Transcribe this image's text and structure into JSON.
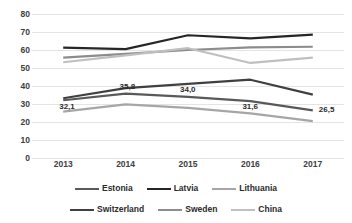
{
  "chart_data": {
    "type": "line",
    "title": "",
    "xlabel": "",
    "ylabel": "",
    "categories": [
      "2013",
      "2014",
      "2015",
      "2016",
      "2017"
    ],
    "x_tick_labels": [
      "2013",
      "2014",
      "2015",
      "2016",
      "2017"
    ],
    "y_tick_labels": [
      "0",
      "10",
      "20",
      "30",
      "40",
      "50",
      "60",
      "70",
      "80"
    ],
    "y_ticks": [
      0,
      10,
      20,
      30,
      40,
      50,
      60,
      70,
      80
    ],
    "ylim": [
      0,
      80
    ],
    "grid": true,
    "grid_axis": "y",
    "legend_position": "bottom",
    "decimal_separator": ",",
    "series": [
      {
        "name": "Estonia",
        "color": "#595959",
        "width": 2.2,
        "values": [
          32.1,
          35.8,
          34.0,
          31.6,
          26.5
        ],
        "labels": [
          "32,1",
          "35,8",
          "34,0",
          "31,6",
          "26,5"
        ]
      },
      {
        "name": "Latvia",
        "color": "#262626",
        "width": 2.2,
        "values": [
          61.3,
          60.5,
          68.2,
          66.5,
          68.5
        ],
        "labels": [
          "",
          "",
          "",
          "",
          ""
        ]
      },
      {
        "name": "Lithuania",
        "color": "#a6a6a6",
        "width": 2.2,
        "values": [
          25.8,
          29.8,
          27.8,
          24.8,
          20.5
        ],
        "labels": [
          "",
          "",
          "",
          "",
          ""
        ]
      },
      {
        "name": "Switzerland",
        "color": "#404040",
        "width": 2.2,
        "values": [
          33.2,
          38.8,
          41.2,
          43.5,
          35.2
        ],
        "labels": [
          "",
          "",
          "",
          "",
          ""
        ]
      },
      {
        "name": "Sweden",
        "color": "#8c8c8c",
        "width": 2.2,
        "values": [
          55.8,
          57.8,
          60.0,
          61.5,
          61.8
        ],
        "labels": [
          "",
          "",
          "",
          "",
          ""
        ]
      },
      {
        "name": "China",
        "color": "#bfbfbf",
        "width": 2.2,
        "values": [
          53.2,
          57.0,
          61.0,
          52.8,
          55.8
        ],
        "labels": [
          "",
          "",
          "",
          "",
          ""
        ]
      }
    ],
    "visible_data_labels": [
      {
        "series": "Estonia",
        "category": "2013",
        "text": "32,1"
      },
      {
        "series": "Estonia",
        "category": "2014",
        "text": "35,8"
      },
      {
        "series": "Estonia",
        "category": "2015",
        "text": "34,0"
      },
      {
        "series": "Estonia",
        "category": "2016",
        "text": "31,6"
      },
      {
        "series": "Estonia",
        "category": "2017",
        "text": "26,5"
      }
    ],
    "legend_rows": [
      [
        "Estonia",
        "Latvia",
        "Lithuania"
      ],
      [
        "Switzerland",
        "Sweden",
        "China"
      ]
    ],
    "colors": {
      "background": "#ffffff",
      "gridline": "#e4e4e4",
      "axis_text": "#404040",
      "label_text": "#2b2b2b"
    }
  }
}
